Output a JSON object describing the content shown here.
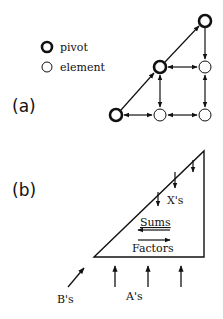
{
  "panel_a": {
    "label": "(a)",
    "legend": {
      "pivot_label": "pivot",
      "element_label": "element"
    },
    "nodes": [
      {
        "id": "top-pivot",
        "type": "pivot",
        "x": 205,
        "y": 21
      },
      {
        "id": "mid-pivot",
        "type": "pivot",
        "x": 160,
        "y": 67
      },
      {
        "id": "mid-right",
        "type": "element",
        "x": 205,
        "y": 67
      },
      {
        "id": "bottom-pivot",
        "type": "pivot",
        "x": 116,
        "y": 115
      },
      {
        "id": "bottom-mid",
        "type": "element",
        "x": 160,
        "y": 115
      },
      {
        "id": "bottom-right",
        "type": "element",
        "x": 205,
        "y": 115
      }
    ]
  },
  "panel_b": {
    "label": "(b)",
    "x_label": "X's",
    "sums_label": "Sums",
    "factors_label": "Factors",
    "b_label": "B's",
    "a_label": "A's"
  },
  "colors": {
    "ink": "#111111",
    "background": "#ffffff"
  }
}
